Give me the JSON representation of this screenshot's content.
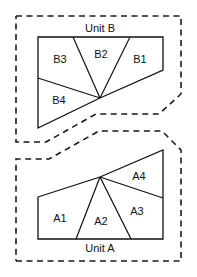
{
  "canvas": {
    "width": 197,
    "height": 277,
    "background_color": "#ffffff"
  },
  "style": {
    "line_color": "#111111",
    "dashed_color": "#1a1a1a",
    "fill_color": "#ffffff",
    "text_color": "#111111"
  },
  "units": [
    {
      "id": "unit-b",
      "title": "Unit B",
      "title_position": "top",
      "title_x": 100,
      "title_y": 29,
      "boundary_points": "16,16 181,16 181,94 159,114 96,114 46,142 16,142 16,16",
      "shape_points": "38,37 163,37 163,70 100,98 38,128 38,37",
      "fan_vertex_x": 100,
      "fan_vertex_y": 98,
      "dividers": [
        {
          "name": "divider-b3-b2",
          "x1": 100,
          "y1": 98,
          "x2": 73,
          "y2": 37
        },
        {
          "name": "divider-b2-b1",
          "x1": 100,
          "y1": 98,
          "x2": 130,
          "y2": 37
        },
        {
          "name": "divider-b4-b3",
          "x1": 100,
          "y1": 98,
          "x2": 38,
          "y2": 78
        }
      ],
      "regions": [
        {
          "id": "b3",
          "label": "B3",
          "x": 60,
          "y": 60
        },
        {
          "id": "b2",
          "label": "B2",
          "x": 101,
          "y": 55
        },
        {
          "id": "b1",
          "label": "B1",
          "x": 140,
          "y": 60
        },
        {
          "id": "b4",
          "label": "B4",
          "x": 59,
          "y": 101
        }
      ]
    },
    {
      "id": "unit-a",
      "title": "Unit A",
      "title_position": "bottom",
      "title_x": 100,
      "title_y": 249,
      "boundary_points": "16,261 181,261 181,150 162,131 99,131 49,159 16,159 16,261",
      "shape_points": "38,197 100,177 163,150 163,239 38,239 38,197",
      "fan_vertex_x": 100,
      "fan_vertex_y": 177,
      "dividers": [
        {
          "name": "divider-a1-a2",
          "x1": 100,
          "y1": 177,
          "x2": 76,
          "y2": 239
        },
        {
          "name": "divider-a2-a3",
          "x1": 100,
          "y1": 177,
          "x2": 131,
          "y2": 239
        },
        {
          "name": "divider-a3-a4",
          "x1": 100,
          "y1": 177,
          "x2": 163,
          "y2": 198
        }
      ],
      "regions": [
        {
          "id": "a1",
          "label": "A1",
          "x": 60,
          "y": 219
        },
        {
          "id": "a2",
          "label": "A2",
          "x": 101,
          "y": 222
        },
        {
          "id": "a3",
          "label": "A3",
          "x": 137,
          "y": 212
        },
        {
          "id": "a4",
          "label": "A4",
          "x": 139,
          "y": 177
        }
      ]
    }
  ]
}
